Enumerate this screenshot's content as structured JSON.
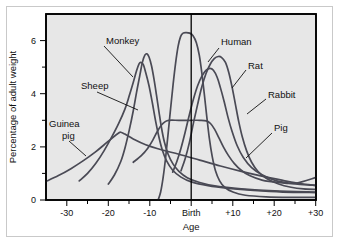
{
  "figure": {
    "background_color": "#ffffff",
    "frame_color": "#c9c9c9",
    "plot_background_color": "#e7e7e7",
    "curve_color": "#4a4a55",
    "axis_color": "#000000"
  },
  "axes": {
    "x_title": "Age",
    "y_title": "Percentage of adult weight",
    "x_ticks": [
      "-30",
      "-20",
      "-10",
      "Birth",
      "+10",
      "+20",
      "+30"
    ],
    "x_tick_values": [
      -30,
      -20,
      -10,
      0,
      10,
      20,
      30
    ],
    "y_ticks": [
      "0",
      "2",
      "4",
      "6"
    ],
    "y_tick_values": [
      0,
      2,
      4,
      6
    ],
    "y_minor_values": [
      1,
      3,
      5
    ],
    "birth_marker": "Birth"
  },
  "series_labels": [
    {
      "name": "Monkey",
      "text": "Monkey"
    },
    {
      "name": "Sheep",
      "text": "Sheep"
    },
    {
      "name": "Guinea pig",
      "text": "Guinea"
    },
    {
      "name": "Guinea pig second line",
      "text": "pig"
    },
    {
      "name": "Human",
      "text": "Human"
    },
    {
      "name": "Rat",
      "text": "Rat"
    },
    {
      "name": "Rabbit",
      "text": "Rabbit"
    },
    {
      "name": "Pig",
      "text": "Pig"
    }
  ],
  "chart_data": {
    "type": "line",
    "title": "",
    "xlabel": "Age",
    "ylabel": "Percentage of adult weight",
    "xlim": [
      -35,
      30
    ],
    "ylim": [
      0,
      7
    ],
    "grid": false,
    "legend": "inline-labels",
    "annotations": [
      {
        "text": "Birth",
        "x": 0,
        "type": "vertical-reference-line"
      }
    ],
    "series": [
      {
        "name": "Guinea pig",
        "label_text": "Guinea pig",
        "peak_value": 2.55,
        "peak_x": -17,
        "points": [
          [
            -35,
            0.7
          ],
          [
            -32,
            0.92
          ],
          [
            -29,
            1.18
          ],
          [
            -26,
            1.48
          ],
          [
            -23,
            1.82
          ],
          [
            -21,
            2.08
          ],
          [
            -19,
            2.34
          ],
          [
            -17.5,
            2.52
          ],
          [
            -17,
            2.55
          ],
          [
            -16,
            2.48
          ],
          [
            -14,
            2.3
          ],
          [
            -11,
            2.08
          ],
          [
            -7,
            1.88
          ],
          [
            -3,
            1.72
          ],
          [
            2,
            1.5
          ],
          [
            7,
            1.28
          ],
          [
            12,
            1.08
          ],
          [
            17,
            0.9
          ],
          [
            22,
            0.74
          ],
          [
            26,
            0.62
          ],
          [
            30,
            0.55
          ]
        ]
      },
      {
        "name": "Sheep",
        "label_text": "Sheep",
        "peak_value": 5.18,
        "peak_x": -12.5,
        "points": [
          [
            -27,
            0.72
          ],
          [
            -25,
            1.0
          ],
          [
            -23,
            1.38
          ],
          [
            -21,
            1.86
          ],
          [
            -19,
            2.42
          ],
          [
            -17.5,
            2.88
          ],
          [
            -16,
            3.42
          ],
          [
            -15,
            3.9
          ],
          [
            -14,
            4.42
          ],
          [
            -13.2,
            4.86
          ],
          [
            -12.6,
            5.12
          ],
          [
            -12.2,
            5.18
          ],
          [
            -11.6,
            5.1
          ],
          [
            -11,
            4.8
          ],
          [
            -10.2,
            4.3
          ],
          [
            -9.4,
            3.66
          ],
          [
            -8.6,
            2.96
          ],
          [
            -7.8,
            2.36
          ],
          [
            -7,
            1.88
          ],
          [
            -6,
            1.48
          ],
          [
            -4.5,
            1.12
          ],
          [
            -2.5,
            0.86
          ],
          [
            0,
            0.68
          ],
          [
            4,
            0.54
          ],
          [
            9,
            0.44
          ],
          [
            15,
            0.36
          ],
          [
            22,
            0.3
          ],
          [
            30,
            0.28
          ]
        ]
      },
      {
        "name": "Monkey",
        "label_text": "Monkey",
        "peak_value": 5.5,
        "peak_x": -11,
        "points": [
          [
            -20,
            0.6
          ],
          [
            -18.5,
            0.95
          ],
          [
            -17,
            1.45
          ],
          [
            -16,
            1.95
          ],
          [
            -15,
            2.6
          ],
          [
            -14,
            3.35
          ],
          [
            -13.2,
            4.05
          ],
          [
            -12.4,
            4.7
          ],
          [
            -11.8,
            5.18
          ],
          [
            -11.2,
            5.45
          ],
          [
            -10.7,
            5.5
          ],
          [
            -10.2,
            5.38
          ],
          [
            -9.6,
            5.05
          ],
          [
            -9,
            4.55
          ],
          [
            -8.4,
            3.95
          ],
          [
            -7.8,
            3.32
          ],
          [
            -7.2,
            2.72
          ],
          [
            -6.5,
            2.18
          ],
          [
            -5.6,
            1.72
          ],
          [
            -4.4,
            1.35
          ],
          [
            -3,
            1.08
          ],
          [
            -1,
            0.84
          ],
          [
            2,
            0.66
          ],
          [
            6,
            0.52
          ],
          [
            12,
            0.42
          ],
          [
            20,
            0.34
          ],
          [
            30,
            0.3
          ]
        ]
      },
      {
        "name": "Human",
        "label_text": "Human",
        "peak_value": 6.3,
        "peak_x": -1,
        "points": [
          [
            -8,
            0.0
          ],
          [
            -7.4,
            0.3
          ],
          [
            -6.8,
            0.85
          ],
          [
            -6.2,
            1.6
          ],
          [
            -5.6,
            2.5
          ],
          [
            -5,
            3.45
          ],
          [
            -4.4,
            4.35
          ],
          [
            -3.8,
            5.15
          ],
          [
            -3.2,
            5.78
          ],
          [
            -2.6,
            6.15
          ],
          [
            -2,
            6.28
          ],
          [
            -1.2,
            6.3
          ],
          [
            -0.4,
            6.28
          ],
          [
            0.4,
            6.18
          ],
          [
            1.2,
            5.92
          ],
          [
            1.9,
            5.45
          ],
          [
            2.5,
            4.8
          ],
          [
            3.1,
            4.0
          ],
          [
            3.7,
            3.15
          ],
          [
            4.3,
            2.35
          ],
          [
            5,
            1.65
          ],
          [
            5.8,
            1.1
          ],
          [
            6.8,
            0.72
          ],
          [
            8,
            0.48
          ],
          [
            10,
            0.3
          ],
          [
            13,
            0.18
          ],
          [
            18,
            0.12
          ],
          [
            24,
            0.1
          ],
          [
            30,
            0.1
          ]
        ]
      },
      {
        "name": "Rat",
        "label_text": "Rat",
        "peak_value": 5.4,
        "peak_x": 7,
        "points": [
          [
            -2.5,
            1.1
          ],
          [
            -1.5,
            1.55
          ],
          [
            -0.5,
            2.15
          ],
          [
            0.5,
            2.9
          ],
          [
            1.5,
            3.6
          ],
          [
            2.5,
            4.25
          ],
          [
            3.5,
            4.75
          ],
          [
            4.5,
            5.1
          ],
          [
            5.5,
            5.32
          ],
          [
            6.5,
            5.4
          ],
          [
            7.3,
            5.36
          ],
          [
            8.2,
            5.18
          ],
          [
            9,
            4.8
          ],
          [
            9.8,
            4.25
          ],
          [
            10.6,
            3.6
          ],
          [
            11.4,
            2.95
          ],
          [
            12.3,
            2.35
          ],
          [
            13.3,
            1.85
          ],
          [
            14.5,
            1.42
          ],
          [
            16,
            1.08
          ],
          [
            18,
            0.82
          ],
          [
            21,
            0.6
          ],
          [
            24,
            0.48
          ],
          [
            27,
            0.42
          ],
          [
            30,
            0.4
          ]
        ]
      },
      {
        "name": "Rabbit",
        "label_text": "Rabbit",
        "peak_value": 4.95,
        "peak_x": 5,
        "points": [
          [
            -4.5,
            1.05
          ],
          [
            -3.5,
            1.45
          ],
          [
            -2.5,
            1.95
          ],
          [
            -1.5,
            2.55
          ],
          [
            -0.5,
            3.2
          ],
          [
            0.5,
            3.8
          ],
          [
            1.5,
            4.3
          ],
          [
            2.5,
            4.65
          ],
          [
            3.5,
            4.88
          ],
          [
            4.5,
            4.95
          ],
          [
            5.3,
            4.88
          ],
          [
            6.2,
            4.62
          ],
          [
            7,
            4.22
          ],
          [
            7.9,
            3.7
          ],
          [
            8.8,
            3.12
          ],
          [
            9.8,
            2.58
          ],
          [
            11,
            2.05
          ],
          [
            12.5,
            1.6
          ],
          [
            14.5,
            1.22
          ],
          [
            17,
            0.95
          ],
          [
            20,
            0.75
          ],
          [
            24,
            0.62
          ],
          [
            27,
            0.58
          ],
          [
            30,
            0.55
          ]
        ]
      },
      {
        "name": "Pig",
        "label_text": "Pig",
        "peak_value": 3.0,
        "peak_x": 0,
        "plateau": [
          -5,
          4
        ],
        "points": [
          [
            -14,
            1.42
          ],
          [
            -12,
            1.68
          ],
          [
            -10.5,
            1.95
          ],
          [
            -9.2,
            2.28
          ],
          [
            -8.2,
            2.58
          ],
          [
            -7.2,
            2.82
          ],
          [
            -6.3,
            2.95
          ],
          [
            -5.4,
            3.0
          ],
          [
            -3,
            3.0
          ],
          [
            0,
            3.0
          ],
          [
            2,
            3.0
          ],
          [
            3.6,
            2.98
          ],
          [
            4.6,
            2.88
          ],
          [
            5.6,
            2.66
          ],
          [
            6.6,
            2.35
          ],
          [
            7.7,
            2.0
          ],
          [
            8.9,
            1.68
          ],
          [
            10.3,
            1.38
          ],
          [
            12,
            1.12
          ],
          [
            14,
            0.92
          ],
          [
            17,
            0.75
          ],
          [
            21,
            0.66
          ],
          [
            25,
            0.63
          ],
          [
            30,
            0.85
          ]
        ]
      }
    ]
  }
}
